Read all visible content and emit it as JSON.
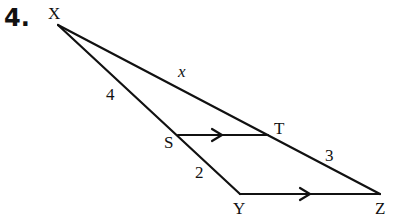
{
  "problem_number": "4.",
  "vertices": {
    "X": {
      "label": "X",
      "x": 58,
      "y": 25
    },
    "S": {
      "label": "S",
      "x": 178,
      "y": 135
    },
    "T": {
      "label": "T",
      "x": 268,
      "y": 135
    },
    "Y": {
      "label": "Y",
      "x": 240,
      "y": 194
    },
    "Z": {
      "label": "Z",
      "x": 380,
      "y": 194
    }
  },
  "segment_labels": {
    "XT": "x",
    "XS": "4",
    "SY": "2",
    "TZ": "3"
  },
  "parallel_marks": [
    "ST",
    "YZ"
  ],
  "colors": {
    "stroke": "#111111"
  }
}
